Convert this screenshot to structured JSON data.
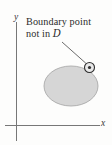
{
  "figure": {
    "background_color": "#fdfdfc",
    "annotation": {
      "line1": "Boundary point",
      "line2_prefix": "not in ",
      "line2_symbol": "D",
      "full_text": "Boundary point not in D",
      "text_color": "#2b2b2b"
    },
    "axes": {
      "y_label": "y",
      "x_label": "x",
      "axis_color": "#6b6b6b",
      "y_axis": {
        "x": 16.5,
        "y_top": 22,
        "y_bottom": 141
      },
      "x_axis": {
        "y": 125.5,
        "x_left": 5,
        "x_right": 100
      }
    },
    "region": {
      "name": "D",
      "shape": "ellipse",
      "center_x": 71,
      "center_y": 86,
      "radius_x": 27,
      "radius_y": 20,
      "fill_color": "#d6d6d6",
      "stroke_color": "#a8a8a8"
    },
    "boundary_point": {
      "label": "boundary point",
      "center_x": 89.5,
      "center_y": 67.5,
      "outer_radius": 5,
      "inner_radius": 1.6,
      "stroke_color": "#2f2f2f",
      "dot_color": "#2f2f2f"
    },
    "leader_line": {
      "x1": 62,
      "y1": 42,
      "x2": 86,
      "y2": 63,
      "color": "#555555"
    }
  }
}
